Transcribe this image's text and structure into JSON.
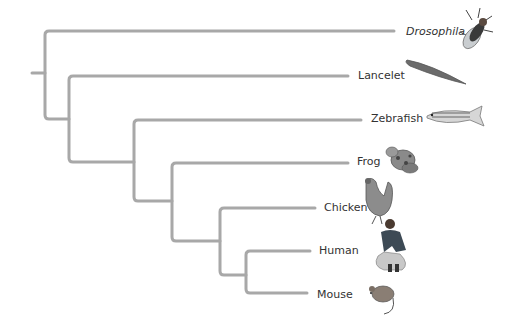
{
  "diagram": {
    "type": "phylogenetic-tree",
    "branch_color": "#a8a8a8",
    "taxa": [
      {
        "name": "Drosophila",
        "italic": true,
        "icon": "fruit-fly-icon"
      },
      {
        "name": "Lancelet",
        "italic": false,
        "icon": "lancelet-icon"
      },
      {
        "name": "Zebrafish",
        "italic": false,
        "icon": "zebrafish-icon"
      },
      {
        "name": "Frog",
        "italic": false,
        "icon": "frog-icon"
      },
      {
        "name": "Chicken",
        "italic": false,
        "icon": "chicken-icon"
      },
      {
        "name": "Human",
        "italic": false,
        "icon": "human-icon"
      },
      {
        "name": "Mouse",
        "italic": false,
        "icon": "mouse-icon"
      }
    ]
  }
}
